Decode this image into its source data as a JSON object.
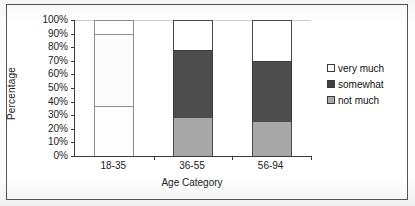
{
  "chart_data": {
    "type": "bar",
    "subtype": "stacked-percentage-column",
    "title": "",
    "xlabel": "Age Category",
    "ylabel": "Percentage",
    "categories": [
      "18-35",
      "36-55",
      "56-94"
    ],
    "series": [
      {
        "name": "not much",
        "values": [
          37,
          29,
          26
        ],
        "color": "#a8a8a8"
      },
      {
        "name": "somewhat",
        "values": [
          53,
          49,
          44
        ],
        "color": "#4d4d4d"
      },
      {
        "name": "very much",
        "values": [
          10,
          22,
          30
        ],
        "color": "#ffffff"
      }
    ],
    "stack_order_bottom_to_top": [
      "not much",
      "somewhat",
      "very much"
    ],
    "cumulative_boundaries_percent": {
      "18-35": [
        37,
        90,
        100
      ],
      "36-55": [
        29,
        78,
        100
      ],
      "56-94": [
        26,
        70,
        100
      ]
    },
    "ylim": [
      0,
      100
    ],
    "ytick_labels": [
      "0%",
      "10%",
      "20%",
      "30%",
      "40%",
      "50%",
      "60%",
      "70%",
      "80%",
      "90%",
      "100%"
    ],
    "ytick_values": [
      0,
      10,
      20,
      30,
      40,
      50,
      60,
      70,
      80,
      90,
      100
    ],
    "grid": false,
    "legend_position": "right",
    "legend_entries": [
      {
        "label": "very much",
        "swatch": "verymuch"
      },
      {
        "label": "somewhat",
        "swatch": "somewhat"
      },
      {
        "label": "not much",
        "swatch": "notmuch"
      }
    ]
  }
}
